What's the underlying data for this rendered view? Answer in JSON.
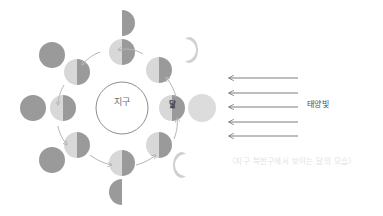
{
  "figure": {
    "title_center": "지구",
    "moon_marker": "달",
    "sunlight_label": "태양빛",
    "caption": "〈지구 북반구에서 보이는 달의 모습〉"
  },
  "colors": {
    "background": "#ffffff",
    "earth_outline": "#8e8e8e",
    "moon_dark": "#9a9a9a",
    "moon_light": "#d8d8d8",
    "moon_mid": "#c0c0c0",
    "full_moon": "#dcdcdc",
    "arrow": "#b5b5b5",
    "ray": "#6e6e6e",
    "caption_text": "#e2e2e2",
    "label_text": "#4a4a4a"
  },
  "earth": {
    "cx": 122,
    "cy": 108,
    "r": 26,
    "label": "지구"
  },
  "orbit": {
    "cx": 122,
    "cy": 108,
    "rx": 52,
    "ry": 58,
    "direction": "counterclockwise",
    "moons": [
      {
        "name": "orbit-moon-right",
        "cx": 172,
        "cy": 108,
        "r": 13,
        "lit": "left"
      },
      {
        "name": "orbit-moon-upper-right",
        "cx": 159,
        "cy": 70,
        "r": 13,
        "lit": "left"
      },
      {
        "name": "orbit-moon-top",
        "cx": 122,
        "cy": 52,
        "r": 13,
        "lit": "left"
      },
      {
        "name": "orbit-moon-upper-left",
        "cx": 77,
        "cy": 72,
        "r": 13,
        "lit": "left"
      },
      {
        "name": "orbit-moon-left",
        "cx": 63,
        "cy": 108,
        "r": 13,
        "lit": "left"
      },
      {
        "name": "orbit-moon-lower-left",
        "cx": 77,
        "cy": 145,
        "r": 13,
        "lit": "left"
      },
      {
        "name": "orbit-moon-bottom",
        "cx": 122,
        "cy": 163,
        "r": 13,
        "lit": "left"
      },
      {
        "name": "orbit-moon-lower-right",
        "cx": 159,
        "cy": 145,
        "r": 13,
        "lit": "left"
      }
    ]
  },
  "phases": [
    {
      "name": "phase-full-moon",
      "cx": 202,
      "cy": 108,
      "r": 14,
      "shape": "full",
      "korean": "보름달"
    },
    {
      "name": "phase-waning-crescent",
      "cx": 188,
      "cy": 50,
      "r": 11,
      "shape": "crescent-right",
      "korean": "그믐달"
    },
    {
      "name": "phase-last-quarter",
      "cx": 122,
      "cy": 23,
      "r": 13,
      "shape": "half-right",
      "korean": "하현달"
    },
    {
      "name": "phase-new-moon-upper-left",
      "cx": 52,
      "cy": 55,
      "r": 13,
      "shape": "new",
      "korean": "삭"
    },
    {
      "name": "phase-new-moon-left",
      "cx": 33,
      "cy": 108,
      "r": 13,
      "shape": "new",
      "korean": "삭"
    },
    {
      "name": "phase-new-moon-lower-left",
      "cx": 52,
      "cy": 160,
      "r": 13,
      "shape": "new",
      "korean": "삭"
    },
    {
      "name": "phase-first-quarter",
      "cx": 122,
      "cy": 192,
      "r": 13,
      "shape": "half-left",
      "korean": "상현달"
    },
    {
      "name": "phase-waxing-crescent",
      "cx": 182,
      "cy": 165,
      "r": 11,
      "shape": "crescent-left",
      "korean": "초승달"
    }
  ],
  "sun_rays": {
    "label": "태양빛",
    "x_start": 298,
    "x_end": 229,
    "ys": [
      78,
      93,
      107,
      122,
      136
    ],
    "direction": "pointing-left"
  },
  "orbit_arrows": [
    {
      "name": "orbit-arrow-ne"
    },
    {
      "name": "orbit-arrow-nw"
    },
    {
      "name": "orbit-arrow-w"
    },
    {
      "name": "orbit-arrow-sw"
    },
    {
      "name": "orbit-arrow-se"
    },
    {
      "name": "orbit-arrow-e"
    }
  ]
}
